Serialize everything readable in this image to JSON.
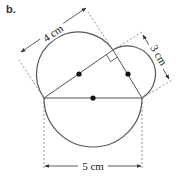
{
  "part_label": "b.",
  "dimensions": {
    "side_ac": "4 cm",
    "side_cb": "3 cm",
    "side_ab": "5 cm"
  },
  "colors": {
    "stroke": "#555555",
    "dashed": "#777777",
    "dot": "#111111"
  }
}
